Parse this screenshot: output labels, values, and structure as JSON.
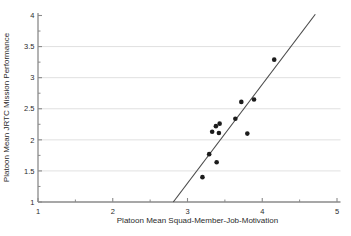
{
  "figure": {
    "background": "#ffffff"
  },
  "chart_data": {
    "type": "scatter",
    "title": "",
    "xlabel": "Platoon Mean Squad-Member-Job-Motivation",
    "ylabel": "Platoon Mean JRTC Mission Performance",
    "xlim": [
      1,
      5
    ],
    "ylim": [
      1,
      4
    ],
    "x_major_ticks": [
      1,
      2,
      3,
      4,
      5
    ],
    "x_minor_ticks": [
      1.5,
      2.5,
      3.5,
      4.5
    ],
    "y_major_ticks": [
      1,
      1.5,
      2,
      2.5,
      3,
      3.5,
      4
    ],
    "y_minor_ticks": [
      1.25,
      1.75,
      2.25,
      2.75,
      3.25,
      3.75
    ],
    "y_gridlines": [
      1.5,
      2,
      2.5,
      3,
      3.5
    ],
    "grid": "horizontal-only",
    "legend": "none",
    "points": [
      {
        "x": 3.2,
        "y": 1.4
      },
      {
        "x": 3.29,
        "y": 1.77
      },
      {
        "x": 3.33,
        "y": 2.13
      },
      {
        "x": 3.38,
        "y": 2.22
      },
      {
        "x": 3.39,
        "y": 1.64
      },
      {
        "x": 3.42,
        "y": 2.11
      },
      {
        "x": 3.43,
        "y": 2.26
      },
      {
        "x": 3.64,
        "y": 2.34
      },
      {
        "x": 3.72,
        "y": 2.61
      },
      {
        "x": 3.8,
        "y": 2.1
      },
      {
        "x": 3.89,
        "y": 2.65
      },
      {
        "x": 4.16,
        "y": 3.29
      }
    ],
    "trend_line": {
      "x1": 2.81,
      "y1": 1.0,
      "x2": 4.71,
      "y2": 4.02
    },
    "colors": {
      "point": "#1c1c1c",
      "trend": "#4a4a4a",
      "grid": "#dcdcdc",
      "axis": "#8a8a8a",
      "text": "#2b2b2b"
    }
  }
}
